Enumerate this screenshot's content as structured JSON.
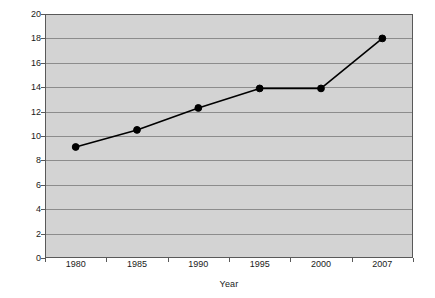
{
  "chart_data": {
    "type": "line",
    "title": "",
    "xlabel": "Year",
    "ylabel": "Percent",
    "categories": [
      "1980",
      "1985",
      "1990",
      "1995",
      "2000",
      "2007"
    ],
    "values": [
      9.1,
      10.5,
      12.3,
      13.9,
      13.9,
      18.0
    ],
    "series": [
      {
        "name": "Percent",
        "values": [
          9.1,
          10.5,
          12.3,
          13.9,
          13.9,
          18.0
        ]
      }
    ],
    "ylim": [
      0,
      20
    ],
    "ytick_step": 2,
    "yticks": [
      "0",
      "2",
      "4",
      "6",
      "8",
      "10",
      "12",
      "14",
      "16",
      "18",
      "20"
    ],
    "grid": "horizontal",
    "legend": "none",
    "marker": "circle",
    "colors": {
      "line": "#000000",
      "marker": "#000000",
      "plot_background": "#d3d3d3",
      "gridline": "#8c8c8c",
      "plot_border": "#595959",
      "page_background": "#ffffff",
      "text": "#1a1a1a"
    }
  }
}
